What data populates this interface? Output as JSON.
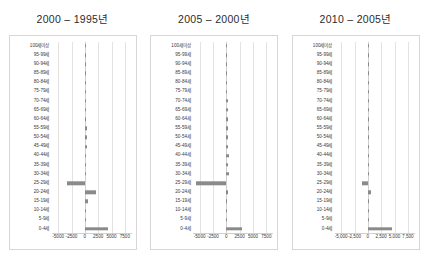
{
  "figure": {
    "age_labels": [
      "100세이상",
      "95-99세",
      "90-94세",
      "85-89세",
      "80-84세",
      "75-79세",
      "70-74세",
      "65-69세",
      "60-64세",
      "55-59세",
      "50-54세",
      "45-49세",
      "40-44세",
      "35-39세",
      "30-34세",
      "25-29세",
      "20-24세",
      "15-19세",
      "10-14세",
      "5-9세",
      "0-4세"
    ],
    "bar_color": "#8a8a8a",
    "grid_color": "#e2e2e2",
    "frame_color": "#d6d6d6"
  },
  "chart_data": [
    {
      "type": "bar",
      "title": "2000 – 1995년",
      "orientation": "horizontal",
      "xlabel": "",
      "ylabel": "",
      "xlim": [
        -6250,
        8750
      ],
      "ticks": [
        -5000,
        -2500,
        0,
        2500,
        5000,
        7500
      ],
      "tick_labels": [
        "-5000",
        "-2500",
        "0",
        "2500",
        "5000",
        "7500"
      ],
      "grid": true,
      "categories": [
        "100세이상",
        "95-99세",
        "90-94세",
        "85-89세",
        "80-84세",
        "75-79세",
        "70-74세",
        "65-69세",
        "60-64세",
        "55-59세",
        "50-54세",
        "45-49세",
        "40-44세",
        "35-39세",
        "30-34세",
        "25-29세",
        "20-24세",
        "15-19세",
        "10-14세",
        "5-9세",
        "0-4세"
      ],
      "values": [
        10,
        30,
        60,
        110,
        160,
        200,
        210,
        230,
        250,
        330,
        420,
        350,
        180,
        300,
        300,
        -3300,
        2100,
        620,
        250,
        120,
        4300
      ]
    },
    {
      "type": "bar",
      "title": "2005 – 2000년",
      "orientation": "horizontal",
      "xlabel": "",
      "ylabel": "",
      "xlim": [
        -6250,
        8750
      ],
      "ticks": [
        -5000,
        -2500,
        0,
        2500,
        5000,
        7500
      ],
      "tick_labels": [
        "-5000",
        "-2500",
        "0",
        "2500",
        "5000",
        "7500"
      ],
      "grid": true,
      "categories": [
        "100세이상",
        "95-99세",
        "90-94세",
        "85-89세",
        "80-84세",
        "75-79세",
        "70-74세",
        "65-69세",
        "60-64세",
        "55-59세",
        "50-54세",
        "45-49세",
        "40-44세",
        "35-39세",
        "30-34세",
        "25-29세",
        "20-24세",
        "15-19세",
        "10-14세",
        "5-9세",
        "0-4세"
      ],
      "values": [
        20,
        40,
        80,
        130,
        180,
        210,
        240,
        260,
        300,
        340,
        380,
        300,
        420,
        260,
        480,
        -5600,
        330,
        80,
        20,
        10,
        2900
      ]
    },
    {
      "type": "bar",
      "title": "2010 – 2005년",
      "orientation": "horizontal",
      "xlabel": "",
      "ylabel": "",
      "xlim": [
        -6250,
        8750
      ],
      "ticks": [
        -5000,
        -2500,
        0,
        2500,
        5000,
        7500
      ],
      "tick_labels": [
        "-5,000",
        "-2,500",
        "0",
        "2,500",
        "5,000",
        "7,500"
      ],
      "grid": true,
      "categories": [
        "100세이상",
        "95-99세",
        "90-94세",
        "85-89세",
        "80-84세",
        "75-79세",
        "70-74세",
        "65-69세",
        "60-64세",
        "55-59세",
        "50-54세",
        "45-49세",
        "40-44세",
        "35-39세",
        "30-34세",
        "25-29세",
        "20-24세",
        "15-19세",
        "10-14세",
        "5-9세",
        "0-4세"
      ],
      "values": [
        30,
        90,
        160,
        200,
        240,
        230,
        200,
        150,
        120,
        140,
        110,
        90,
        130,
        70,
        180,
        -1150,
        520,
        200,
        60,
        120,
        4600
      ]
    }
  ]
}
